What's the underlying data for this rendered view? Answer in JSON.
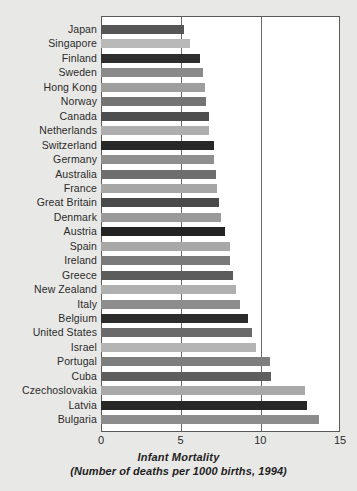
{
  "chart_data": {
    "type": "bar",
    "orientation": "horizontal",
    "title": "Infant Mortality",
    "subtitle": "(Number of deaths per 1000 births, 1994)",
    "xlabel": "Infant Mortality",
    "ylabel": "",
    "xlim": [
      0,
      15
    ],
    "xticks": [
      0,
      5,
      10,
      15
    ],
    "xtick_labels": [
      "0",
      "5",
      "10",
      "15"
    ],
    "grid": true,
    "gridlines_at": [
      5,
      10
    ],
    "legend": null,
    "categories": [
      "Japan",
      "Singapore",
      "Finland",
      "Sweden",
      "Hong Kong",
      "Norway",
      "Canada",
      "Netherlands",
      "Switzerland",
      "Germany",
      "Australia",
      "France",
      "Great Britain",
      "Denmark",
      "Austria",
      "Spain",
      "Ireland",
      "Greece",
      "New Zealand",
      "Italy",
      "Belgium",
      "United States",
      "Israel",
      "Portugal",
      "Cuba",
      "Czechoslovakia",
      "Latvia",
      "Bulgaria"
    ],
    "values": [
      5.2,
      5.6,
      6.2,
      6.4,
      6.5,
      6.6,
      6.8,
      6.8,
      7.1,
      7.1,
      7.2,
      7.3,
      7.4,
      7.5,
      7.8,
      8.1,
      8.1,
      8.3,
      8.5,
      8.7,
      9.2,
      9.5,
      9.7,
      10.6,
      10.7,
      12.8,
      12.9,
      13.7
    ],
    "bar_colors": [
      "#565656",
      "#b9b9b9",
      "#2e2e2e",
      "#8a8a8a",
      "#9e9e9e",
      "#747474",
      "#4e4e4e",
      "#aeaeae",
      "#282828",
      "#8f8f8f",
      "#6e6e6e",
      "#a6a6a6",
      "#4a4a4a",
      "#9a9a9a",
      "#232323",
      "#a8a8a8",
      "#7a7a7a",
      "#5c5c5c",
      "#b0b0b0",
      "#8d8d8d",
      "#2c2c2c",
      "#6a6a6a",
      "#b4b4b4",
      "#7e7e7e",
      "#5e5e5e",
      "#a9a9a9",
      "#272727",
      "#8c8c8c"
    ]
  },
  "colors": {
    "page_background": "#e8e8e6",
    "plot_background": "#ffffff",
    "axis_line": "#5a5a5a",
    "gridline": "#6b6b6b",
    "text": "#2b2b2b"
  }
}
